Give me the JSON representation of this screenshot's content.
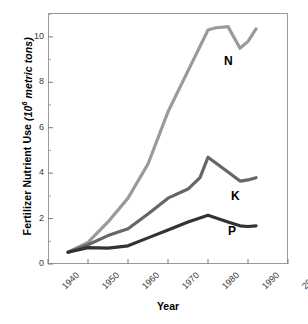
{
  "chart_data": {
    "type": "line",
    "title": "",
    "xlabel": "Year",
    "ylabel_text": "Fertilizer Nutrient Use",
    "ylabel_unit_prefix": "(10",
    "ylabel_unit_sup": "6",
    "ylabel_unit_suffix": " metric tons)",
    "xlim": [
      1940,
      2000
    ],
    "ylim": [
      0,
      11.05
    ],
    "xticks": [
      1940,
      1950,
      1960,
      1970,
      1980,
      1990,
      2000
    ],
    "xticklabels": [
      "1940",
      "1950",
      "1960",
      "1970",
      "1980",
      "1990",
      "2000"
    ],
    "yticks": [
      0,
      2,
      4,
      6,
      8,
      10
    ],
    "yticklabels": [
      "0",
      "2",
      "4",
      "6",
      "8",
      "10"
    ],
    "yminorticks": [
      1,
      3,
      5,
      7,
      9,
      11
    ],
    "grid": false,
    "legend": "inline-labels",
    "series": [
      {
        "name": "N",
        "label": "N",
        "color": "#9a9a9a",
        "x": [
          1945,
          1950,
          1955,
          1960,
          1965,
          1970,
          1975,
          1980,
          1982,
          1985,
          1988,
          1990,
          1992
        ],
        "values": [
          0.52,
          0.95,
          1.85,
          2.9,
          4.4,
          6.7,
          8.5,
          10.3,
          10.4,
          10.45,
          9.5,
          9.8,
          10.35
        ]
      },
      {
        "name": "K",
        "label": "K",
        "color": "#666666",
        "x": [
          1945,
          1950,
          1955,
          1960,
          1965,
          1970,
          1975,
          1978,
          1980,
          1985,
          1988,
          1990,
          1992
        ],
        "values": [
          0.52,
          0.85,
          1.25,
          1.55,
          2.2,
          2.9,
          3.3,
          3.8,
          4.7,
          4.05,
          3.65,
          3.7,
          3.8
        ]
      },
      {
        "name": "P",
        "label": "P",
        "color": "#333333",
        "x": [
          1945,
          1950,
          1955,
          1960,
          1965,
          1970,
          1975,
          1980,
          1985,
          1988,
          1990,
          1992
        ],
        "values": [
          0.52,
          0.72,
          0.7,
          0.8,
          1.15,
          1.5,
          1.85,
          2.15,
          1.85,
          1.68,
          1.65,
          1.68
        ]
      }
    ]
  }
}
